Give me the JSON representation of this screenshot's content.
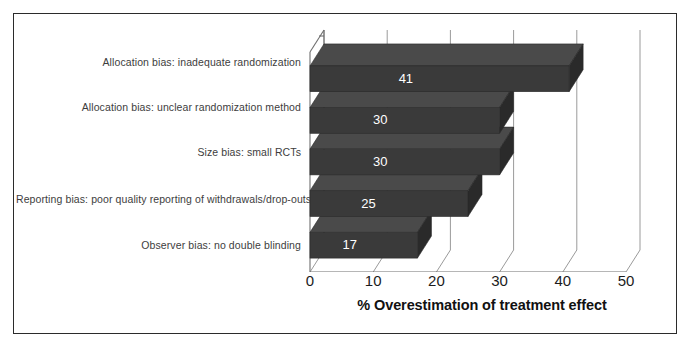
{
  "chart_data": {
    "type": "bar",
    "orientation": "horizontal",
    "title": "",
    "xlabel": "% Overestimation of treatment effect",
    "ylabel": "",
    "categories": [
      "Allocation bias: inadequate randomization",
      "Allocation bias: unclear randomization method",
      "Size bias: small RCTs",
      "Reporting bias: poor quality reporting of withdrawals/drop-outs",
      "Observer bias: no double blinding"
    ],
    "values": [
      41,
      30,
      30,
      25,
      17
    ],
    "value_labels": [
      "41",
      "30",
      "30",
      "25",
      "17"
    ],
    "xlim": [
      0,
      50
    ],
    "xticks": [
      0,
      10,
      20,
      30,
      40,
      50
    ],
    "xtick_labels": [
      "0",
      "10",
      "20",
      "30",
      "40",
      "50"
    ],
    "grid": true,
    "grid_axis": "x",
    "legend": false,
    "style": "3d",
    "colors": {
      "bar_face": "#3a3a3a",
      "bar_top": "#4a4a4a",
      "bar_side": "#2a2a2a",
      "value_label": "#ffffff",
      "gridline": "#9a9a9a",
      "axis": "#6e6e6e",
      "frame": "#2b2b2b",
      "category_label": "#3d3d3d",
      "tick_label": "#1c1c1c",
      "axis_title": "#111111",
      "background": "#ffffff"
    }
  }
}
